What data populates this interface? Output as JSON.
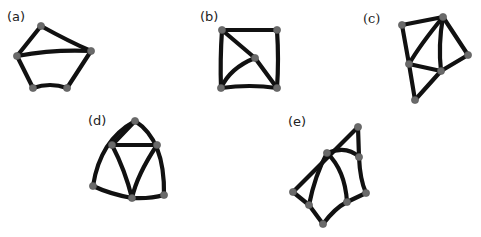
{
  "figure": {
    "background": "#ffffff",
    "edge_color": "#111111",
    "node_color": "#6a6a6a",
    "panels": [
      {
        "id": "a",
        "label": "(a)",
        "label_pos": [
          7,
          21
        ],
        "nodes": [
          [
            41,
            26
          ],
          [
            17,
            56
          ],
          [
            91,
            51
          ],
          [
            33,
            88
          ],
          [
            67,
            88
          ]
        ],
        "edges": [
          "M17,56 L41,26",
          "M41,26 Q70,42 91,51",
          "M17,56 Q55,49 91,51",
          "M17,56 L33,88",
          "M91,51 L67,88",
          "M33,88 Q50,82 67,88"
        ]
      },
      {
        "id": "b",
        "label": "(b)",
        "label_pos": [
          200,
          21
        ],
        "nodes": [
          [
            222,
            30
          ],
          [
            277,
            30
          ],
          [
            255,
            58
          ],
          [
            221,
            88
          ],
          [
            277,
            88
          ]
        ],
        "edges": [
          "M222,30 L277,30",
          "M222,30 Q220,60 221,88",
          "M277,30 Q279,60 277,88",
          "M221,88 Q250,84 277,88",
          "M222,30 L255,58",
          "M255,58 L277,88",
          "M255,58 Q230,68 221,88"
        ]
      },
      {
        "id": "c",
        "label": "(c)",
        "label_pos": [
          363,
          23
        ],
        "nodes": [
          [
            402,
            25
          ],
          [
            443,
            17
          ],
          [
            468,
            55
          ],
          [
            409,
            64
          ],
          [
            441,
            71
          ],
          [
            415,
            100
          ]
        ],
        "edges": [
          "M402,25 L443,17",
          "M402,25 L409,64",
          "M443,17 L468,55",
          "M443,17 Q420,45 409,64",
          "M443,17 Q438,45 441,71",
          "M409,64 L441,71",
          "M441,71 L468,55",
          "M409,64 L415,100",
          "M415,100 L441,71"
        ]
      },
      {
        "id": "d",
        "label": "(d)",
        "label_pos": [
          88,
          125
        ],
        "nodes": [
          [
            135,
            121
          ],
          [
            112,
            145
          ],
          [
            157,
            145
          ],
          [
            93,
            186
          ],
          [
            132,
            198
          ],
          [
            164,
            195
          ]
        ],
        "edges": [
          "M112,145 L135,121",
          "M135,121 Q165,140 164,195",
          "M135,121 Q100,140 93,186",
          "M112,145 L157,145",
          "M112,145 Q125,170 132,198",
          "M157,145 Q137,175 132,198",
          "M93,186 Q110,194 132,198",
          "M132,198 Q150,199 164,195"
        ]
      },
      {
        "id": "e",
        "label": "(e)",
        "label_pos": [
          288,
          126
        ],
        "nodes": [
          [
            358,
            127
          ],
          [
            327,
            153
          ],
          [
            359,
            157
          ],
          [
            293,
            192
          ],
          [
            309,
            205
          ],
          [
            347,
            202
          ],
          [
            366,
            193
          ],
          [
            323,
            224
          ]
        ],
        "edges": [
          "M293,192 L358,127",
          "M358,127 L359,157",
          "M327,153 Q347,145 359,157",
          "M359,157 Q360,180 366,193",
          "M327,153 Q345,170 347,202",
          "M327,153 Q315,175 309,205",
          "M293,192 L309,205",
          "M309,205 L323,224",
          "M323,224 Q335,208 347,202",
          "M347,202 L366,193"
        ]
      }
    ]
  }
}
